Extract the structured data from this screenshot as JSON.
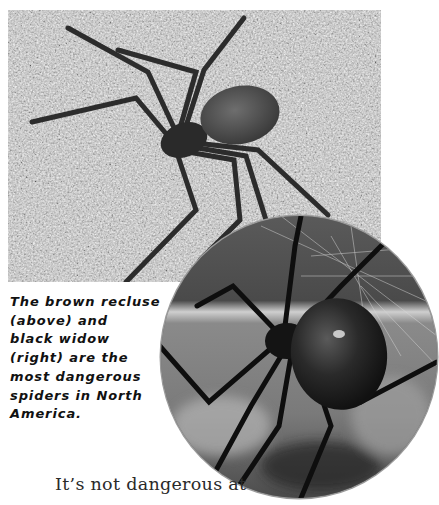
{
  "photos": {
    "top": {
      "subject": "brown recluse spider on web",
      "alt": "Brown recluse spider"
    },
    "circle": {
      "subject": "black widow spider in web",
      "alt": "Black widow spider"
    }
  },
  "caption": {
    "lines": [
      "The brown recluse",
      "(above) and",
      "black widow",
      "(right) are the",
      "most dangerous",
      "spiders in North",
      "America."
    ]
  },
  "body": {
    "text": "It’s not dangerous at"
  },
  "colors": {
    "caption_text": "#111111",
    "body_text": "#2a2a2a",
    "background": "#ffffff"
  }
}
